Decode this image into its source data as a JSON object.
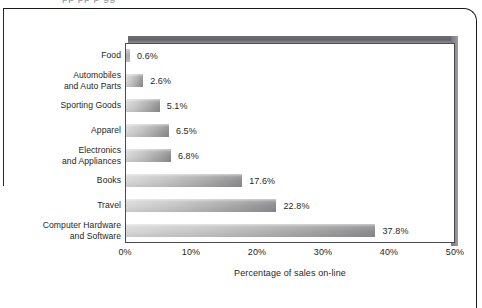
{
  "page": {
    "cropped_top_text": "pp             pp         p     gg"
  },
  "chart_data": {
    "type": "bar",
    "orientation": "horizontal",
    "title": "",
    "xlabel": "Percentage of sales on-line",
    "ylabel": "",
    "xlim": [
      0,
      50
    ],
    "xticks": [
      "0%",
      "10%",
      "20%",
      "30%",
      "40%",
      "50%"
    ],
    "xtick_values": [
      0,
      10,
      20,
      30,
      40,
      50
    ],
    "grid": false,
    "legend": null,
    "categories": [
      "Food",
      "Automobiles\nand Auto Parts",
      "Sporting Goods",
      "Apparel",
      "Electronics\nand Appliances",
      "Books",
      "Travel",
      "Computer Hardware\nand Software"
    ],
    "values": [
      0.6,
      2.6,
      5.1,
      6.5,
      6.8,
      17.6,
      22.8,
      37.8
    ],
    "value_labels": [
      "0.6%",
      "2.6%",
      "5.1%",
      "6.5%",
      "6.8%",
      "17.6%",
      "22.8%",
      "37.8%"
    ],
    "colors": {
      "bar_light": "#d8d8d8",
      "bar_dark": "#8d8d90",
      "plot_border": "#4a4a50",
      "plot_shadow": "#6e6e72",
      "text": "#1f1f22",
      "background": "#ffffff"
    }
  }
}
